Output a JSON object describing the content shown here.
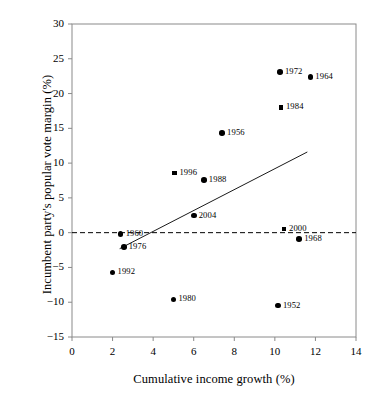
{
  "chart_data": {
    "type": "scatter",
    "title": "",
    "xlabel": "Cumulative income growth (%)",
    "ylabel": "Incumbent party's popular vote margin (%)",
    "xlim": [
      0,
      14
    ],
    "ylim": [
      -15,
      30
    ],
    "xticks": [
      0,
      2,
      4,
      6,
      8,
      10,
      12,
      14
    ],
    "yticks": [
      -15,
      -10,
      -5,
      0,
      5,
      10,
      15,
      20,
      25,
      30
    ],
    "xtick_labels": [
      "0",
      "2",
      "4",
      "6",
      "8",
      "10",
      "12",
      "14"
    ],
    "ytick_labels": [
      "−15",
      "−10",
      "−5",
      "0",
      "5",
      "10",
      "15",
      "20",
      "25",
      "30"
    ],
    "grid": false,
    "legend": "none",
    "zero_line": {
      "y": 0,
      "style": "dashed",
      "color": "#000000"
    },
    "trend_line": {
      "style": "solid",
      "color": "#000000",
      "x_start": 2.35,
      "y_start": -2.3,
      "x_end": 11.6,
      "y_end": 11.6
    },
    "points": [
      {
        "label": "1952",
        "x": 10.15,
        "y": -10.5,
        "marker": "circle",
        "label_pos": "right"
      },
      {
        "label": "1956",
        "x": 7.4,
        "y": 14.3,
        "marker": "circle",
        "label_pos": "right"
      },
      {
        "label": "1960",
        "x": 2.4,
        "y": -0.15,
        "marker": "circle",
        "label_pos": "right"
      },
      {
        "label": "1964",
        "x": 11.75,
        "y": 22.4,
        "marker": "circle",
        "label_pos": "right"
      },
      {
        "label": "1968",
        "x": 11.2,
        "y": -0.95,
        "marker": "circle",
        "label_pos": "right"
      },
      {
        "label": "1972",
        "x": 10.25,
        "y": 23.1,
        "marker": "circle",
        "label_pos": "right"
      },
      {
        "label": "1976",
        "x": 2.55,
        "y": -2.05,
        "marker": "circle",
        "label_pos": "right"
      },
      {
        "label": "1980",
        "x": 5.0,
        "y": -9.6,
        "marker": "circle",
        "label_pos": "right"
      },
      {
        "label": "1984",
        "x": 10.3,
        "y": 18.0,
        "marker": "square",
        "label_pos": "right"
      },
      {
        "label": "1988",
        "x": 6.5,
        "y": 7.6,
        "marker": "circle",
        "label_pos": "right"
      },
      {
        "label": "1992",
        "x": 2.0,
        "y": -5.7,
        "marker": "circle",
        "label_pos": "right"
      },
      {
        "label": "1996",
        "x": 5.05,
        "y": 8.55,
        "marker": "square",
        "label_pos": "right"
      },
      {
        "label": "2000",
        "x": 10.45,
        "y": 0.5,
        "marker": "square",
        "label_pos": "right"
      },
      {
        "label": "2004",
        "x": 6.0,
        "y": 2.45,
        "marker": "circle",
        "label_pos": "right"
      }
    ]
  },
  "colors": {
    "marker": "#000000",
    "axis": "#8a8a8a",
    "background": "#ffffff"
  }
}
